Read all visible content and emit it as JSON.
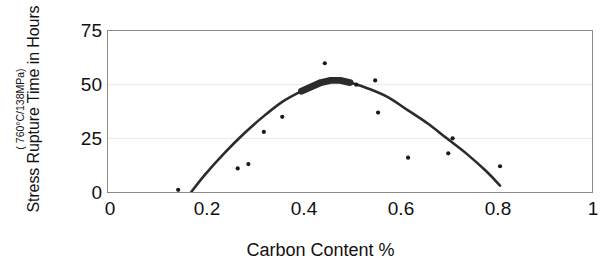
{
  "chart_data": {
    "type": "scatter",
    "title": "",
    "xlabel": "Carbon Content %",
    "ylabel": "Stress Rupture Time in Hours",
    "ylabel_sub": "( 760°C/138MPa)",
    "xlim": [
      0,
      1
    ],
    "ylim": [
      0,
      75
    ],
    "xticks": [
      "0",
      "0.2",
      "0.4",
      "0.6",
      "0.8",
      "1"
    ],
    "xtick_values": [
      0,
      0.2,
      0.4,
      0.6,
      0.8,
      1
    ],
    "yticks": [
      "0",
      "25",
      "50",
      "75"
    ],
    "ytick_values": [
      0,
      25,
      50,
      75
    ],
    "grid": "horizontal-faint",
    "legend": "none",
    "series": [
      {
        "name": "Measured stress rupture life",
        "marker": "dot",
        "color": "#1a1a1a",
        "points": [
          {
            "x": 0.145,
            "y": 1
          },
          {
            "x": 0.268,
            "y": 11
          },
          {
            "x": 0.29,
            "y": 13
          },
          {
            "x": 0.322,
            "y": 28
          },
          {
            "x": 0.36,
            "y": 35
          },
          {
            "x": 0.448,
            "y": 60
          },
          {
            "x": 0.513,
            "y": 50
          },
          {
            "x": 0.552,
            "y": 52
          },
          {
            "x": 0.558,
            "y": 37
          },
          {
            "x": 0.62,
            "y": 16
          },
          {
            "x": 0.703,
            "y": 18
          },
          {
            "x": 0.712,
            "y": 25
          },
          {
            "x": 0.81,
            "y": 12
          }
        ]
      },
      {
        "name": "Fitted trend curve",
        "marker": "line",
        "color": "#2b2b2b",
        "note": "thick parabolic best-fit, peak near x=0.45",
        "points": [
          {
            "x": 0.172,
            "y": 0
          },
          {
            "x": 0.2,
            "y": 8
          },
          {
            "x": 0.24,
            "y": 18
          },
          {
            "x": 0.28,
            "y": 27
          },
          {
            "x": 0.32,
            "y": 35
          },
          {
            "x": 0.36,
            "y": 42
          },
          {
            "x": 0.4,
            "y": 47
          },
          {
            "x": 0.44,
            "y": 51
          },
          {
            "x": 0.46,
            "y": 52
          },
          {
            "x": 0.48,
            "y": 52
          },
          {
            "x": 0.5,
            "y": 51
          },
          {
            "x": 0.54,
            "y": 48
          },
          {
            "x": 0.58,
            "y": 44
          },
          {
            "x": 0.62,
            "y": 38
          },
          {
            "x": 0.66,
            "y": 32
          },
          {
            "x": 0.7,
            "y": 25
          },
          {
            "x": 0.74,
            "y": 18
          },
          {
            "x": 0.78,
            "y": 10
          },
          {
            "x": 0.81,
            "y": 3
          }
        ]
      }
    ]
  },
  "axes": {
    "frame_color": "#8a8a8a",
    "gridline_color": "#e8e8e8"
  }
}
